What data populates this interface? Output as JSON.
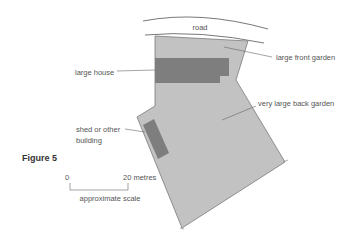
{
  "figure": {
    "label": "Figure 5"
  },
  "labels": {
    "road": "road",
    "large_front_garden": "large front garden",
    "large_house": "large house",
    "very_large_back_garden": "very large back garden",
    "shed_line1": "shed or other",
    "shed_line2": "building"
  },
  "scale": {
    "start": "0",
    "end": "20 metres",
    "caption": "approximate scale"
  },
  "colors": {
    "plot_fill": "#c0c0c0",
    "plot_outline": "#7a7a7a",
    "building_fill": "#7d7d7d",
    "line": "#666666"
  }
}
